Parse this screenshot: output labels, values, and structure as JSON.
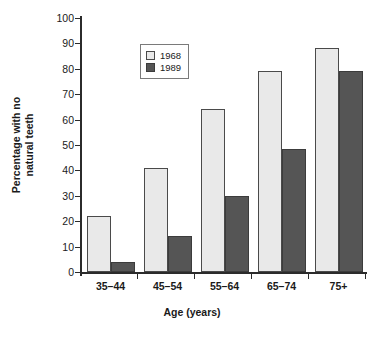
{
  "chart_data": {
    "type": "bar",
    "title": "",
    "xlabel": "Age (years)",
    "ylabel_line1": "Percentage with no",
    "ylabel_line2": "natural teeth",
    "categories": [
      "35–44",
      "45–54",
      "55–64",
      "65–74",
      "75+"
    ],
    "series": [
      {
        "name": "1968",
        "color": "#e9e9e9",
        "values": [
          22,
          41,
          64,
          79,
          88
        ]
      },
      {
        "name": "1989",
        "color": "#555555",
        "values": [
          4,
          14,
          30,
          48.5,
          79
        ]
      }
    ],
    "ylim": [
      0,
      100
    ],
    "yticks": [
      0,
      10,
      20,
      30,
      40,
      50,
      60,
      70,
      80,
      90,
      100
    ],
    "ytick_labels": [
      "0",
      "10",
      "20",
      "30",
      "40",
      "50",
      "60",
      "70",
      "80",
      "90",
      "100"
    ],
    "grid": false,
    "legend_position": "upper left",
    "legend_entries": [
      "1968",
      "1989"
    ],
    "axis_color": "#2b2b2b"
  }
}
